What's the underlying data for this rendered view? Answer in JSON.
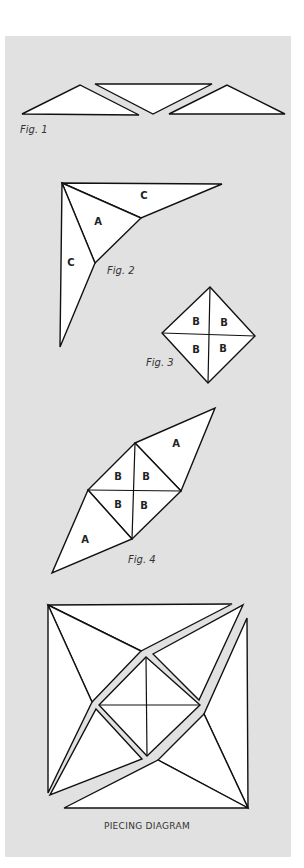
{
  "figures": {
    "fig1": {
      "label": "Fig. 1"
    },
    "fig2": {
      "label": "Fig. 2",
      "pieces": [
        "C",
        "A",
        "C"
      ]
    },
    "fig3": {
      "label": "Fig. 3",
      "pieces": [
        "B",
        "B",
        "B",
        "B"
      ]
    },
    "fig4": {
      "label": "Fig. 4",
      "pieces": [
        "A",
        "B",
        "B",
        "B",
        "B",
        "A"
      ]
    }
  },
  "piecing_diagram": {
    "caption": "PIECING DIAGRAM"
  },
  "colors": {
    "panel": "#e1e1e1",
    "piece_fill": "#ffffff",
    "stroke": "#111111"
  }
}
